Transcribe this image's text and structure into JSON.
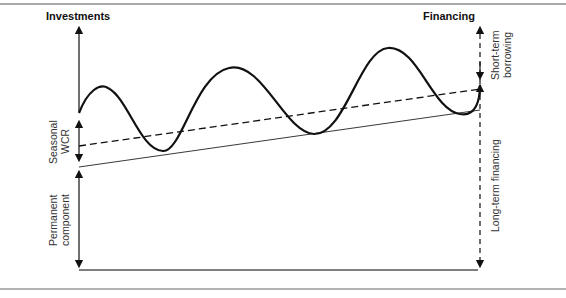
{
  "diagram": {
    "left_header": "Investments",
    "right_header": "Financing",
    "left_labels": {
      "seasonal_wcr": [
        "Seasonal",
        "WCR"
      ],
      "permanent_component": [
        "Permanent",
        "component"
      ]
    },
    "right_labels": {
      "short_term_borrowing": [
        "Short-term",
        "borrowing"
      ],
      "long_term_financing": "Long-term financing"
    },
    "lines": [
      {
        "name": "total-financing-needs",
        "style": "thick-solid-wave"
      },
      {
        "name": "long-term-financing-level",
        "style": "dashed"
      },
      {
        "name": "permanent-component-level",
        "style": "thin-solid"
      }
    ],
    "colors": {
      "ink": "#111111",
      "rule": "#555555",
      "text": "#333333"
    }
  }
}
